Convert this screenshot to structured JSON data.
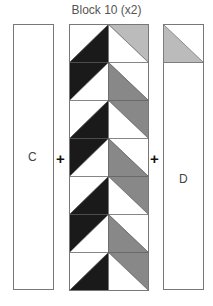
{
  "title": "Block 10 (x2)",
  "panels": {
    "left": {
      "label": "C"
    },
    "right": {
      "label": "D",
      "top_square": "gray lower-left triangle"
    }
  },
  "operators": [
    "+",
    "+"
  ],
  "colors": {
    "black": "#1a1a1a",
    "gray": "#888888",
    "light_gray": "#bbbbbb",
    "outline": "#777777"
  },
  "block": {
    "rows": 7,
    "columns": 2,
    "left_column": [
      "white/black lower-right",
      "black upper-left",
      "white/black lower-right",
      "black upper-left",
      "white/black lower-right",
      "black upper-left",
      "white/black lower-right"
    ],
    "right_column": [
      "light-gray upper-right",
      "gray lower-left",
      "gray upper-right",
      "gray lower-left",
      "gray upper-right",
      "gray lower-left",
      "gray upper-right"
    ]
  }
}
